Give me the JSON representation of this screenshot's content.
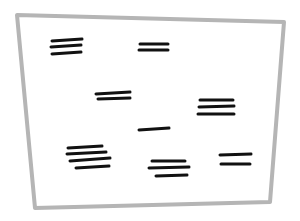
{
  "sketch": {
    "description": "Hand-drawn wireframe: a rectangular frame containing groups of horizontal text-placeholder strokes",
    "frame": {
      "color": "#b5b5b5",
      "stroke_width": 4,
      "corners": [
        [
          17,
          15
        ],
        [
          284,
          22
        ],
        [
          270,
          202
        ],
        [
          35,
          208
        ]
      ]
    },
    "stroke_color": "#111111",
    "line_groups": [
      {
        "name": "group-top-left",
        "lines": [
          [
            52,
            41,
            82,
            39
          ],
          [
            51,
            47,
            81,
            45
          ],
          [
            52,
            54,
            81,
            52
          ]
        ]
      },
      {
        "name": "group-top-center",
        "lines": [
          [
            140,
            44,
            168,
            44
          ],
          [
            139,
            50,
            168,
            50
          ]
        ]
      },
      {
        "name": "group-middle-left",
        "lines": [
          [
            96,
            94,
            130,
            92
          ],
          [
            98,
            99,
            130,
            98
          ]
        ]
      },
      {
        "name": "group-right-middle",
        "lines": [
          [
            200,
            100,
            233,
            100
          ],
          [
            199,
            107,
            234,
            106
          ],
          [
            198,
            114,
            234,
            114
          ]
        ]
      },
      {
        "name": "group-center-single",
        "lines": [
          [
            139,
            130,
            169,
            128
          ]
        ]
      },
      {
        "name": "group-bottom-left",
        "lines": [
          [
            68,
            148,
            102,
            146
          ],
          [
            67,
            154,
            106,
            152
          ],
          [
            70,
            161,
            110,
            158
          ],
          [
            76,
            168,
            109,
            166
          ]
        ]
      },
      {
        "name": "group-bottom-center",
        "lines": [
          [
            152,
            161,
            185,
            161
          ],
          [
            149,
            168,
            189,
            167
          ],
          [
            156,
            176,
            187,
            175
          ]
        ]
      },
      {
        "name": "group-bottom-right",
        "lines": [
          [
            220,
            155,
            251,
            154
          ],
          [
            221,
            164,
            250,
            164
          ]
        ]
      }
    ]
  }
}
